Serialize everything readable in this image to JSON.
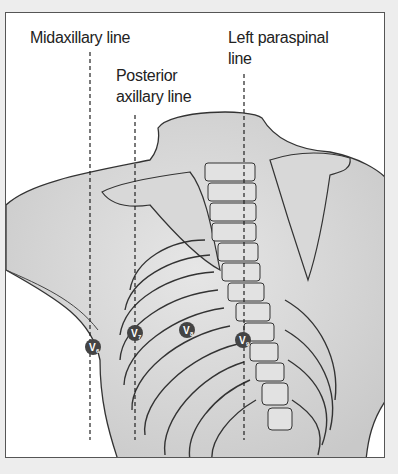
{
  "diagram": {
    "type": "anatomical-illustration",
    "labels": {
      "midaxillary": "Midaxillary line",
      "posterior_axillary_1": "Posterior",
      "posterior_axillary_2": "axillary line",
      "left_paraspinal_1": "Left paraspinal",
      "left_paraspinal_2": "line"
    },
    "lines": [
      {
        "name": "Midaxillary line",
        "x": 90
      },
      {
        "name": "Posterior axillary line",
        "x": 135
      },
      {
        "name": "Left paraspinal line",
        "x": 244
      }
    ],
    "electrodes": [
      {
        "label": "V",
        "sub": "6",
        "x": 93,
        "y": 347
      },
      {
        "label": "V",
        "sub": "7",
        "x": 135,
        "y": 333
      },
      {
        "label": "V",
        "sub": "8",
        "x": 187,
        "y": 330
      },
      {
        "label": "V",
        "sub": "9",
        "x": 243,
        "y": 340
      }
    ]
  }
}
